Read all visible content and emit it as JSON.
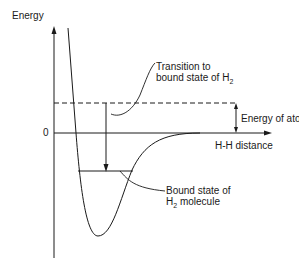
{
  "diagram": {
    "y_axis_label": "Energy",
    "zero_label": "0",
    "x_axis_label": "H-H distance",
    "annotations": {
      "transition": {
        "line1": "Transition to",
        "line2_prefix": "bound state of H",
        "line2_subscript": "2"
      },
      "energy_of_atoms": "Energy of atoms",
      "bound_state": {
        "line1": "Bound state of",
        "line2_prefix": "H",
        "line2_subscript": "2",
        "line2_suffix": " molecule"
      }
    },
    "colors": {
      "line": "#1a1a1a",
      "background": "#ffffff"
    }
  }
}
